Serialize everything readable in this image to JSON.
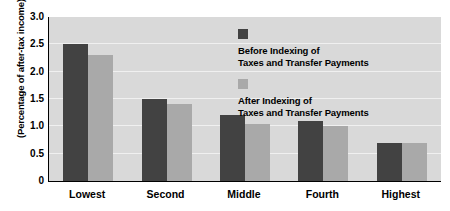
{
  "chart_data": {
    "type": "bar",
    "title": "",
    "subtitle": "",
    "xlabel": "",
    "ylabel": "(Percentage of after-tax income)",
    "categories": [
      "Lowest",
      "Second",
      "Middle",
      "Fourth",
      "Highest"
    ],
    "series": [
      {
        "name": "Before Indexing of Taxes and Transfer Payments",
        "name_line1": "Before Indexing of",
        "name_line2": "Taxes and Transfer Payments",
        "color": "#424242",
        "values": [
          2.5,
          1.5,
          1.2,
          1.1,
          0.7
        ]
      },
      {
        "name": "After Indexing of Taxes and Transfer Payments",
        "name_line1": "After Indexing of",
        "name_line2": "Taxes and Transfer Payments",
        "color": "#a9a9a9",
        "values": [
          2.3,
          1.4,
          1.05,
          1.0,
          0.7
        ]
      }
    ],
    "ylim": [
      0,
      3.0
    ],
    "yticks": [
      0,
      0.5,
      1.0,
      1.5,
      2.0,
      2.5,
      3.0
    ],
    "ytick_labels": [
      "0",
      "0.5",
      "1.0",
      "1.5",
      "2.0",
      "2.5",
      "3.0"
    ],
    "grid": true,
    "grid_axis": "y",
    "legend_position": "upper right inside",
    "plot_background": "#d9d9d9",
    "gridline_color": "#f0f0f0",
    "figure_background": "#ffffff"
  }
}
